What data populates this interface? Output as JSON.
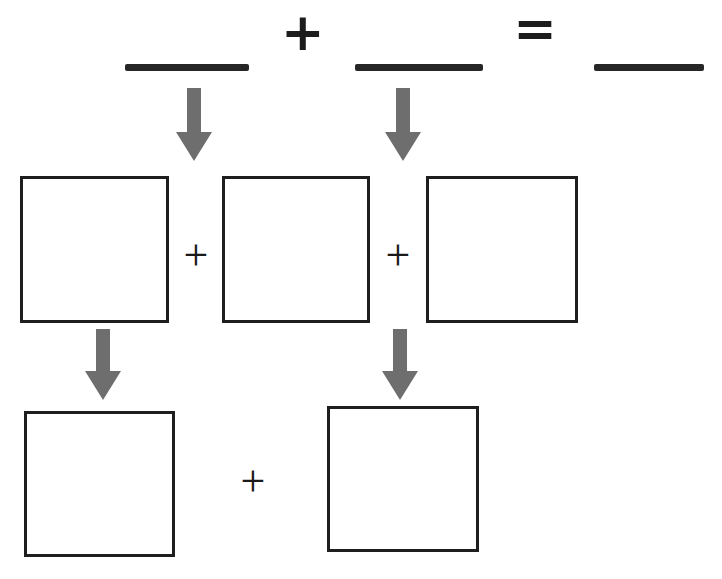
{
  "worksheet": {
    "title": "Addition decomposition worksheet",
    "background_color": "#ffffff",
    "ink_color": "#1e1e1e",
    "arrow_color": "#6e6e6e"
  },
  "equation_row": {
    "name": "top-equation",
    "blank_1": "",
    "operator_1": "+",
    "blank_2": "",
    "operator_2": "=",
    "blank_3": "",
    "blanks": [
      {
        "label": "first-addend-blank",
        "value": ""
      },
      {
        "label": "second-addend-blank",
        "value": ""
      },
      {
        "label": "sum-blank",
        "value": ""
      }
    ],
    "operators": [
      {
        "label": "plus-sign",
        "glyph": "+"
      },
      {
        "label": "equals-sign",
        "glyph": "="
      }
    ]
  },
  "arrows_upper": [
    {
      "label": "arrow-to-box-1",
      "direction": "down"
    },
    {
      "label": "arrow-to-box-3",
      "direction": "down"
    }
  ],
  "middle_row": {
    "name": "three-box-row",
    "boxes": [
      {
        "label": "work-box-1",
        "value": ""
      },
      {
        "label": "work-box-2",
        "value": ""
      },
      {
        "label": "work-box-3",
        "value": ""
      }
    ],
    "operators": [
      {
        "label": "plus-sign-middle-1",
        "glyph": "+"
      },
      {
        "label": "plus-sign-middle-2",
        "glyph": "+"
      }
    ]
  },
  "arrows_lower": [
    {
      "label": "arrow-to-result-box-1",
      "direction": "down"
    },
    {
      "label": "arrow-to-result-box-2",
      "direction": "down"
    }
  ],
  "bottom_row": {
    "name": "two-box-row",
    "boxes": [
      {
        "label": "result-box-1",
        "value": ""
      },
      {
        "label": "result-box-2",
        "value": ""
      }
    ],
    "operators": [
      {
        "label": "plus-sign-bottom",
        "glyph": "+"
      }
    ]
  }
}
